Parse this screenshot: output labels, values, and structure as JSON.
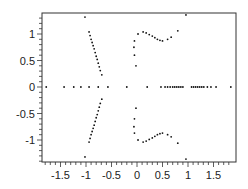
{
  "chart_data": {
    "type": "scatter",
    "title": "",
    "xlabel": "",
    "ylabel": "",
    "xlim": [
      -1.9,
      1.9
    ],
    "ylim": [
      -1.4,
      1.4
    ],
    "grid": false,
    "legend": null,
    "x_ticks": [
      -1.5,
      -1,
      -0.5,
      0,
      0.5,
      1,
      1.5
    ],
    "x_tick_labels": [
      "-1.5",
      "-1",
      "-0.5",
      "0",
      "0.5",
      "1",
      "1.5"
    ],
    "y_ticks": [
      1,
      0.5,
      0,
      -0.5,
      -1
    ],
    "y_tick_labels": [
      "1",
      "0.5",
      "0",
      "-0.5",
      "-1"
    ],
    "series": [
      {
        "name": "left-branch-upper",
        "points": [
          [
            -1.02,
            1.32
          ],
          [
            -0.94,
            1.04
          ],
          [
            -0.92,
            0.97
          ],
          [
            -0.9,
            0.9
          ],
          [
            -0.88,
            0.84
          ],
          [
            -0.86,
            0.78
          ],
          [
            -0.84,
            0.72
          ],
          [
            -0.82,
            0.65
          ],
          [
            -0.8,
            0.58
          ],
          [
            -0.78,
            0.52
          ],
          [
            -0.76,
            0.45
          ],
          [
            -0.74,
            0.38
          ],
          [
            -0.72,
            0.31
          ],
          [
            -0.69,
            0.23
          ]
        ]
      },
      {
        "name": "left-branch-lower",
        "points": [
          [
            -1.02,
            -1.32
          ],
          [
            -0.94,
            -1.04
          ],
          [
            -0.92,
            -0.97
          ],
          [
            -0.9,
            -0.9
          ],
          [
            -0.88,
            -0.84
          ],
          [
            -0.86,
            -0.78
          ],
          [
            -0.84,
            -0.72
          ],
          [
            -0.82,
            -0.65
          ],
          [
            -0.8,
            -0.58
          ],
          [
            -0.78,
            -0.52
          ],
          [
            -0.76,
            -0.45
          ],
          [
            -0.74,
            -0.38
          ],
          [
            -0.72,
            -0.31
          ],
          [
            -0.69,
            -0.23
          ]
        ]
      },
      {
        "name": "right-branch-upper",
        "points": [
          [
            -0.02,
            0.4
          ],
          [
            -0.05,
            0.6
          ],
          [
            -0.06,
            0.75
          ],
          [
            -0.05,
            0.87
          ],
          [
            0.02,
            1.0
          ],
          [
            0.12,
            1.04
          ],
          [
            0.18,
            1.02
          ],
          [
            0.24,
            0.99
          ],
          [
            0.3,
            0.96
          ],
          [
            0.35,
            0.93
          ],
          [
            0.4,
            0.9
          ],
          [
            0.45,
            0.88
          ],
          [
            0.5,
            0.87
          ],
          [
            0.6,
            0.9
          ],
          [
            0.67,
            0.94
          ],
          [
            0.8,
            1.06
          ],
          [
            0.96,
            1.36
          ]
        ]
      },
      {
        "name": "right-branch-lower",
        "points": [
          [
            -0.02,
            -0.4
          ],
          [
            -0.05,
            -0.6
          ],
          [
            -0.06,
            -0.75
          ],
          [
            -0.05,
            -0.87
          ],
          [
            0.02,
            -1.0
          ],
          [
            0.12,
            -1.04
          ],
          [
            0.18,
            -1.02
          ],
          [
            0.24,
            -0.99
          ],
          [
            0.3,
            -0.96
          ],
          [
            0.35,
            -0.93
          ],
          [
            0.4,
            -0.9
          ],
          [
            0.45,
            -0.88
          ],
          [
            0.5,
            -0.87
          ],
          [
            0.6,
            -0.9
          ],
          [
            0.67,
            -0.94
          ],
          [
            0.8,
            -1.06
          ],
          [
            0.96,
            -1.36
          ]
        ]
      },
      {
        "name": "real-axis",
        "points": [
          [
            -1.78,
            0
          ],
          [
            -1.43,
            0
          ],
          [
            -1.24,
            0
          ],
          [
            -1.1,
            0
          ],
          [
            -0.94,
            0
          ],
          [
            -0.76,
            0
          ],
          [
            -0.57,
            0
          ],
          [
            -0.2,
            0
          ],
          [
            0.2,
            0
          ],
          [
            0.47,
            0
          ],
          [
            0.55,
            0
          ],
          [
            0.6,
            0
          ],
          [
            0.65,
            0
          ],
          [
            0.7,
            0
          ],
          [
            0.74,
            0
          ],
          [
            0.78,
            0
          ],
          [
            0.82,
            0
          ],
          [
            0.86,
            0
          ],
          [
            0.9,
            0
          ],
          [
            1.07,
            0
          ],
          [
            1.11,
            0
          ],
          [
            1.15,
            0
          ],
          [
            1.19,
            0
          ],
          [
            1.23,
            0
          ],
          [
            1.27,
            0
          ],
          [
            1.31,
            0
          ],
          [
            1.38,
            0
          ],
          [
            1.45,
            0
          ],
          [
            1.55,
            0
          ],
          [
            1.84,
            0
          ]
        ]
      }
    ]
  },
  "colors": {
    "marker": "#111111",
    "axis": "#333333",
    "background": "#ffffff"
  }
}
